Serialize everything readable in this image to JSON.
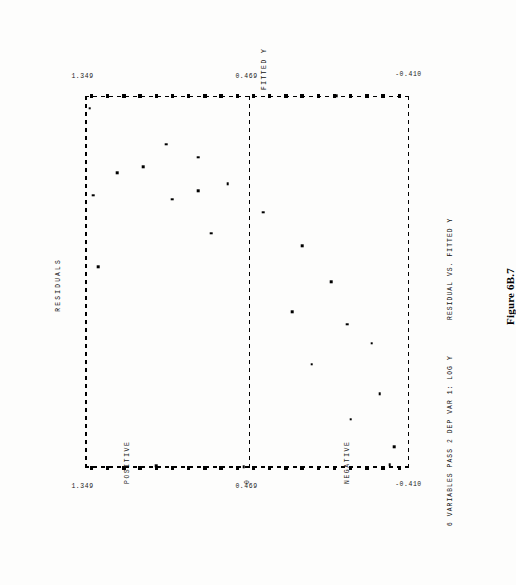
{
  "document": {
    "figure_caption": "Figure 6B.7"
  },
  "header": {
    "run_description": "6 VARIABLES PASS 2  DEP VAR 1: LOG Y",
    "plot_title": "RESIDUAL VS. FITTED Y"
  },
  "chart_data": {
    "type": "scatter",
    "title": "RESIDUAL VS. FITTED Y",
    "subtitle": "6 VARIABLES PASS 2  DEP VAR 1: LOG Y",
    "xlabel": "FITTED Y",
    "ylabel": "RESIDUALS",
    "xlim": [
      -0.41,
      1.349
    ],
    "ylim": [
      -1.0,
      1.0
    ],
    "x_tick_labels": [
      "-0.410",
      "0.469",
      "1.349"
    ],
    "x_tick_values": [
      -0.41,
      0.469,
      1.349
    ],
    "y_region_labels": [
      "POSITIVE",
      "0",
      "NEGATIVE"
    ],
    "grid": false,
    "zero_reference_line": 0,
    "legend": "none",
    "marker": "dot",
    "note": "Axis tick marks are printed as filled squares along both vertical value axes.",
    "points": [
      {
        "x": 1.349,
        "y": 0.86
      },
      {
        "x": 1.29,
        "y": 0.97
      },
      {
        "x": 1.12,
        "y": 0.5
      },
      {
        "x": 1.06,
        "y": 0.3
      },
      {
        "x": 1.015,
        "y": 0.64
      },
      {
        "x": 0.985,
        "y": 0.8
      },
      {
        "x": 0.935,
        "y": 0.12
      },
      {
        "x": 0.9,
        "y": 0.3
      },
      {
        "x": 0.86,
        "y": 0.46
      },
      {
        "x": 0.8,
        "y": -0.1
      },
      {
        "x": 0.7,
        "y": 0.22
      },
      {
        "x": 0.64,
        "y": -0.34
      },
      {
        "x": 0.47,
        "y": -0.52
      },
      {
        "x": 0.33,
        "y": -0.28
      },
      {
        "x": 0.27,
        "y": -0.62
      },
      {
        "x": 0.18,
        "y": -0.77
      },
      {
        "x": 0.08,
        "y": -0.4
      },
      {
        "x": -0.06,
        "y": -0.82
      },
      {
        "x": -0.18,
        "y": -0.64
      },
      {
        "x": -0.31,
        "y": -0.91
      },
      {
        "x": -0.395,
        "y": -0.88
      },
      {
        "x": -0.4,
        "y": 0.56
      },
      {
        "x": -0.405,
        "y": 0.02
      },
      {
        "x": 1.349,
        "y": -0.55
      },
      {
        "x": 0.88,
        "y": 0.95
      },
      {
        "x": 0.54,
        "y": 0.92
      }
    ],
    "axis_tick_squares_left": [
      0.02,
      0.07,
      0.12,
      0.17,
      0.22,
      0.27,
      0.32,
      0.37,
      0.42,
      0.47,
      0.52,
      0.57,
      0.62,
      0.67,
      0.72,
      0.77,
      0.82,
      0.87,
      0.92,
      0.97
    ]
  },
  "icons": {
    "data_point": "dot-icon"
  }
}
